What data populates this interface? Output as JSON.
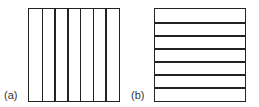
{
  "figure": {
    "panels": [
      {
        "label": "(a)",
        "orientation": "vertical",
        "strips": 7
      },
      {
        "label": "(b)",
        "orientation": "horizontal",
        "strips": 7
      }
    ]
  }
}
